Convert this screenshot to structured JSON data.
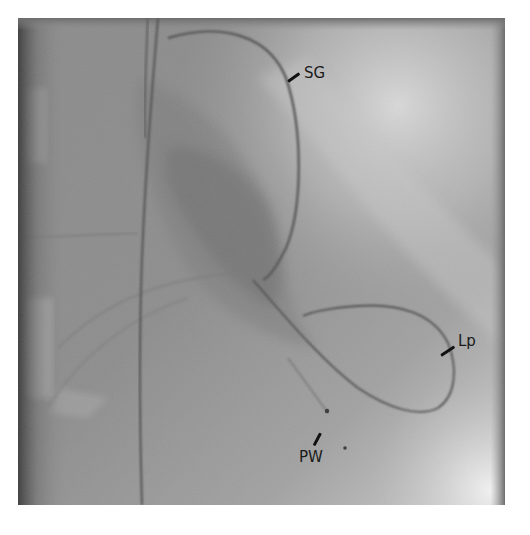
{
  "figure": {
    "type": "fluoroscopy-image",
    "labels": [
      {
        "id": "sg",
        "text": "SG"
      },
      {
        "id": "lp",
        "text": "Lp"
      },
      {
        "id": "pw",
        "text": "PW"
      }
    ]
  },
  "colors": {
    "background": "#ffffff",
    "image_base": "#8f8f8f",
    "image_bright": "#d8d8d8",
    "image_dark": "#6a6a6a",
    "wire": "#4a4a4a",
    "label_text": "#1a1a1a"
  }
}
